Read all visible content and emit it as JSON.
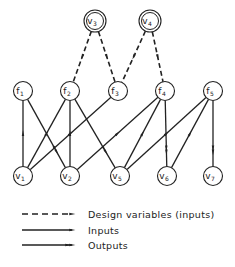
{
  "colors": {
    "stroke": "#222222",
    "background": "#ffffff"
  },
  "design_nodes": [
    {
      "id": "v3",
      "base": "v",
      "sub": "3",
      "x": 95,
      "y": 21
    },
    {
      "id": "v4",
      "base": "v",
      "sub": "4",
      "x": 150,
      "y": 21
    }
  ],
  "function_nodes": [
    {
      "id": "f1",
      "base": "f",
      "sub": "1",
      "x": 23,
      "y": 91
    },
    {
      "id": "f2",
      "base": "f",
      "sub": "2",
      "x": 70,
      "y": 91
    },
    {
      "id": "f3",
      "base": "f",
      "sub": "3",
      "x": 118,
      "y": 91
    },
    {
      "id": "f4",
      "base": "f",
      "sub": "4",
      "x": 165,
      "y": 91
    },
    {
      "id": "f5",
      "base": "f",
      "sub": "5",
      "x": 213,
      "y": 91
    }
  ],
  "variable_nodes": [
    {
      "id": "v1",
      "base": "v",
      "sub": "1",
      "x": 23,
      "y": 176
    },
    {
      "id": "v2",
      "base": "v",
      "sub": "2",
      "x": 70,
      "y": 176
    },
    {
      "id": "v5",
      "base": "v",
      "sub": "5",
      "x": 120,
      "y": 176
    },
    {
      "id": "v6",
      "base": "v",
      "sub": "6",
      "x": 167,
      "y": 176
    },
    {
      "id": "v7",
      "base": "v",
      "sub": "7",
      "x": 213,
      "y": 176
    }
  ],
  "edges": [
    {
      "from": "v3",
      "to": "f2",
      "type": "design"
    },
    {
      "from": "v3",
      "to": "f3",
      "type": "design"
    },
    {
      "from": "v4",
      "to": "f3",
      "type": "design"
    },
    {
      "from": "v4",
      "to": "f4",
      "type": "design"
    },
    {
      "from": "v1",
      "to": "f1",
      "type": "input"
    },
    {
      "from": "f1",
      "to": "v2",
      "type": "output"
    },
    {
      "from": "v1",
      "to": "f2",
      "type": "input"
    },
    {
      "from": "v2",
      "to": "f2",
      "type": "input"
    },
    {
      "from": "f2",
      "to": "v5",
      "type": "output"
    },
    {
      "from": "v1",
      "to": "f3",
      "type": "input"
    },
    {
      "from": "v2",
      "to": "f4",
      "type": "input"
    },
    {
      "from": "v5",
      "to": "f4",
      "type": "input"
    },
    {
      "from": "f4",
      "to": "v6",
      "type": "output"
    },
    {
      "from": "v5",
      "to": "f5",
      "type": "input"
    },
    {
      "from": "v6",
      "to": "f5",
      "type": "input"
    },
    {
      "from": "f5",
      "to": "v7",
      "type": "output"
    }
  ],
  "legend": {
    "items": [
      {
        "type": "design",
        "label": "Design variables (inputs)"
      },
      {
        "type": "input",
        "label": "Inputs"
      },
      {
        "type": "output",
        "label": "Outputs"
      }
    ]
  }
}
